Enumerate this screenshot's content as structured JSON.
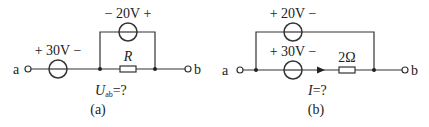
{
  "diagrams": [
    {
      "id": "a",
      "caption": "(a)",
      "question_main": "U",
      "question_sub": "ab",
      "question_tail": "=?",
      "terminal_left": "a",
      "terminal_right": "b",
      "top_source": {
        "label": "− 20V +",
        "value": "20V",
        "polarity_left": "−",
        "polarity_right": "+"
      },
      "series_source": {
        "label": "+ 30V −",
        "value": "30V",
        "polarity_left": "+",
        "polarity_right": "−"
      },
      "resistor": {
        "label": "R"
      }
    },
    {
      "id": "b",
      "caption": "(b)",
      "question_main": "I",
      "question_tail": "=?",
      "terminal_left": "a",
      "terminal_right": "b",
      "top_source": {
        "label": "+ 20V −",
        "value": "20V",
        "polarity_left": "+",
        "polarity_right": "−"
      },
      "series_source": {
        "label": "+ 30V −",
        "value": "30V",
        "polarity_left": "+",
        "polarity_right": "−"
      },
      "resistor": {
        "label": "2Ω"
      },
      "current_arrow": "right"
    }
  ],
  "colors": {
    "line": "#333333",
    "text": "#222222",
    "background": "#ffffff"
  }
}
